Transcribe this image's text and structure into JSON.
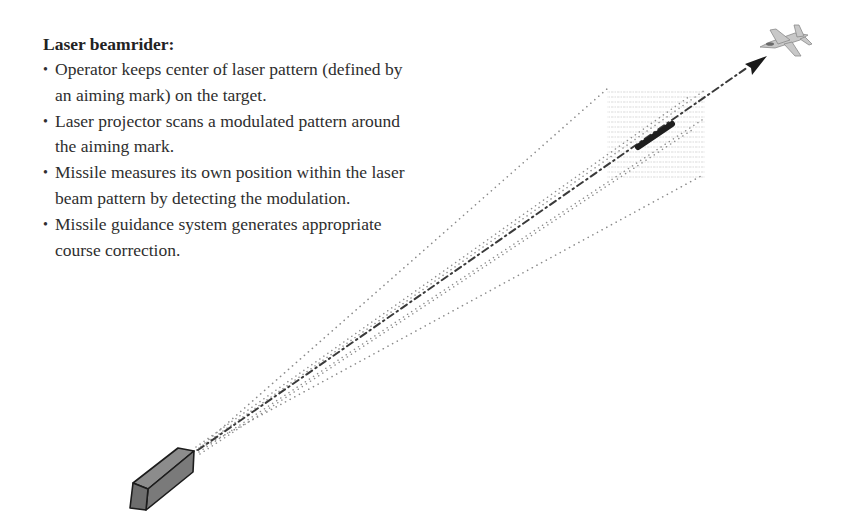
{
  "text": {
    "title": "Laser beamrider:",
    "bullets": [
      {
        "marker": "•",
        "text": "Operator keeps center of laser pattern (defined by an aiming mark) on the target."
      },
      {
        "marker": "•",
        "text": "Laser projector scans a modulated pattern around the aiming mark."
      },
      {
        "marker": "•",
        "text": "Missile measures its own position within the laser beam pattern by detecting the modulation."
      },
      {
        "marker": "•",
        "text": "Missile guidance system generates appropriate course correction."
      }
    ]
  },
  "diagram": {
    "elements": [
      {
        "id": "laser-projector",
        "kind": "launcher-box",
        "color": "#7a7a7a"
      },
      {
        "id": "beam-outer-cone",
        "kind": "dotted-lines",
        "color": "#8a8a8a"
      },
      {
        "id": "beam-inner-cone",
        "kind": "dotted-lines",
        "color": "#9a9a9a"
      },
      {
        "id": "line-of-sight",
        "kind": "dash-dot-arrow",
        "color": "#3a3a3a"
      },
      {
        "id": "scan-pattern",
        "kind": "faint-hatched-square",
        "color": "#e6e6e6"
      },
      {
        "id": "missile",
        "kind": "thick-bar",
        "color": "#1e1e1e"
      },
      {
        "id": "target-aircraft",
        "kind": "jet-icon",
        "color": "#bdbdbd"
      }
    ]
  }
}
